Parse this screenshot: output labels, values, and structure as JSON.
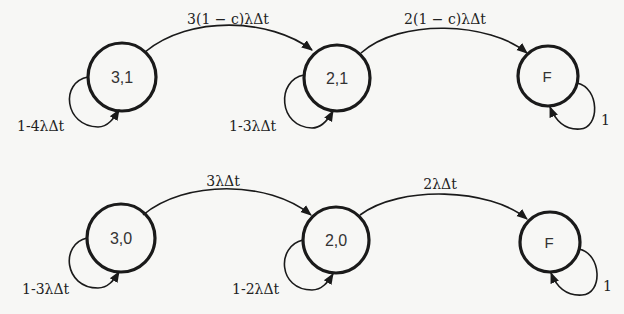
{
  "diagram": {
    "type": "markov-chain",
    "rows": [
      {
        "name": "covered",
        "nodes": [
          {
            "id": "s31",
            "label": "3,1",
            "cx": 122,
            "cy": 77,
            "r": 34
          },
          {
            "id": "s21",
            "label": "2,1",
            "cx": 337,
            "cy": 78,
            "r": 33
          },
          {
            "id": "sF1",
            "label": "F",
            "cx": 548,
            "cy": 76,
            "r": 30
          }
        ],
        "transitions": [
          {
            "from": "s31",
            "to": "s21",
            "label": "3(1 − c)λΔt"
          },
          {
            "from": "s21",
            "to": "sF1",
            "label": "2(1 − c)λΔt"
          }
        ],
        "self_loops": [
          {
            "node": "s31",
            "label": "1-4λΔt"
          },
          {
            "node": "s21",
            "label": "1-3λΔt"
          },
          {
            "node": "sF1",
            "label": "1"
          }
        ]
      },
      {
        "name": "uncovered",
        "nodes": [
          {
            "id": "s30",
            "label": "3,0",
            "cx": 121,
            "cy": 238,
            "r": 34
          },
          {
            "id": "s20",
            "label": "2,0",
            "cx": 336,
            "cy": 240,
            "r": 33
          },
          {
            "id": "sF0",
            "label": "F",
            "cx": 550,
            "cy": 242,
            "r": 30
          }
        ],
        "transitions": [
          {
            "from": "s30",
            "to": "s20",
            "label": "3λΔt"
          },
          {
            "from": "s20",
            "to": "sF0",
            "label": "2λΔt"
          }
        ],
        "self_loops": [
          {
            "node": "s30",
            "label": "1-3λΔt"
          },
          {
            "node": "s20",
            "label": "1-2λΔt"
          },
          {
            "node": "sF0",
            "label": "1"
          }
        ]
      }
    ]
  },
  "labels": {
    "n31": "3,1",
    "n21": "2,1",
    "nF1": "F",
    "n30": "3,0",
    "n20": "2,0",
    "nF0": "F",
    "e31_21": "3(1 − c)λΔt",
    "e21_F": "2(1 − c)λΔt",
    "e30_20": "3λΔt",
    "e20_F": "2λΔt",
    "loop31": "1-4λΔt",
    "loop21": "1-3λΔt",
    "loopF1": "1",
    "loop30": "1-3λΔt",
    "loop20": "1-2λΔt",
    "loopF0": "1"
  },
  "colors": {
    "stroke": "#1a1a1a",
    "background": "#f7f7f5",
    "text": "#333333"
  }
}
